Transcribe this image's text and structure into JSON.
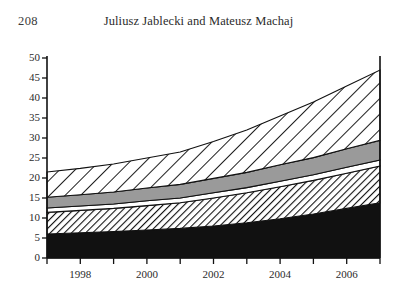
{
  "page": {
    "folio": "208",
    "running_head": "Juliusz Jablecki and Mateusz Machaj",
    "background": "#ffffff",
    "ink": "#1a1a1a"
  },
  "chart_data": {
    "type": "area",
    "title": "",
    "subtitle": "",
    "xlabel": "",
    "ylabel": "",
    "stacked": true,
    "grid": false,
    "legend_position": "none",
    "xlim": [
      1997,
      2007
    ],
    "ylim": [
      0,
      50
    ],
    "yticks": [
      0,
      5,
      10,
      15,
      20,
      25,
      30,
      35,
      40,
      45,
      50
    ],
    "ytick_labels": [
      "0",
      "5",
      "10",
      "15",
      "20",
      "25",
      "30",
      "35",
      "40",
      "45",
      "50"
    ],
    "xticks": [
      1997,
      1998,
      1999,
      2000,
      2001,
      2002,
      2003,
      2004,
      2005,
      2006,
      2007
    ],
    "xtick_labels_shown": [
      "1998",
      "2000",
      "2002",
      "2004",
      "2006"
    ],
    "xtick_labels_shown_at": [
      1998,
      2000,
      2002,
      2004,
      2006
    ],
    "x": [
      1997,
      1998,
      1999,
      2000,
      2001,
      2002,
      2003,
      2004,
      2005,
      2006,
      2007
    ],
    "series": [
      {
        "name": "layer-1-solid-black",
        "fill": "#111111",
        "pattern": "solid",
        "values": [
          6.0,
          6.3,
          6.6,
          7.0,
          7.4,
          8.0,
          8.8,
          9.8,
          11.0,
          12.4,
          13.8
        ]
      },
      {
        "name": "layer-2-fine-hatch",
        "fill": "#ffffff",
        "pattern": "fine-diagonal-hatch",
        "values": [
          5.4,
          5.6,
          5.8,
          6.1,
          6.4,
          7.0,
          7.5,
          8.0,
          8.4,
          8.8,
          9.2
        ]
      },
      {
        "name": "layer-3-thin-white",
        "fill": "#ffffff",
        "pattern": "solid-white",
        "values": [
          1.1,
          1.1,
          1.1,
          1.2,
          1.2,
          1.3,
          1.3,
          1.4,
          1.4,
          1.5,
          1.5
        ]
      },
      {
        "name": "layer-4-gray-band",
        "fill": "#9a9a9a",
        "pattern": "solid-gray",
        "values": [
          2.7,
          2.8,
          3.0,
          3.2,
          3.4,
          3.6,
          3.8,
          4.1,
          4.3,
          4.6,
          4.9
        ]
      },
      {
        "name": "layer-5-coarse-hatch",
        "fill": "#ffffff",
        "pattern": "coarse-diagonal-hatch",
        "values": [
          6.3,
          6.6,
          7.0,
          7.5,
          8.1,
          9.2,
          10.6,
          12.2,
          13.9,
          15.7,
          17.6
        ]
      }
    ],
    "cumulative_tops": {
      "layer-1-solid-black": [
        6.0,
        6.3,
        6.6,
        7.0,
        7.4,
        8.0,
        8.8,
        9.8,
        11.0,
        12.4,
        13.8
      ],
      "layer-2-fine-hatch": [
        11.4,
        11.9,
        12.4,
        13.1,
        13.8,
        15.0,
        16.3,
        17.8,
        19.4,
        21.2,
        23.0
      ],
      "layer-3-thin-white": [
        12.5,
        13.0,
        13.5,
        14.3,
        15.0,
        16.3,
        17.6,
        19.2,
        20.8,
        22.7,
        24.5
      ],
      "layer-4-gray-band": [
        15.2,
        15.8,
        16.5,
        17.5,
        18.4,
        19.9,
        21.4,
        23.3,
        25.1,
        27.3,
        29.4
      ],
      "layer-5-coarse-hatch": [
        21.5,
        22.4,
        23.5,
        25.0,
        26.5,
        29.1,
        32.0,
        35.5,
        39.0,
        43.0,
        47.0
      ]
    }
  }
}
